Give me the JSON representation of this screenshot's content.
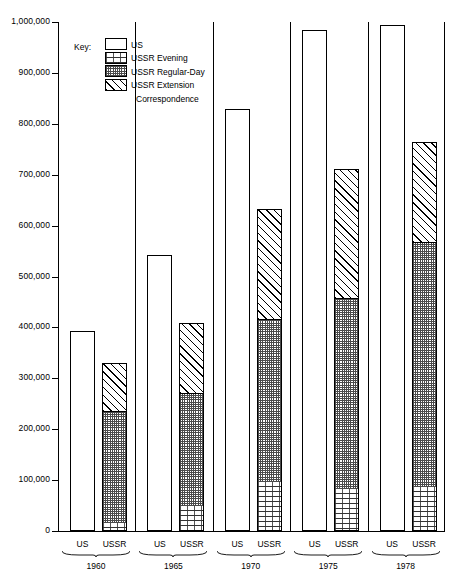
{
  "chart_data": {
    "type": "bar",
    "title": "",
    "subtitle": "",
    "xlabel": "",
    "ylabel": "",
    "ylim": [
      0,
      1000000
    ],
    "grid": false,
    "legend_position": "upper-left-inside",
    "y_ticks": [
      {
        "value": 1000000,
        "label": "1,000,000"
      },
      {
        "value": 900000,
        "label": "900,000"
      },
      {
        "value": 800000,
        "label": "800,000"
      },
      {
        "value": 700000,
        "label": "700,000"
      },
      {
        "value": 600000,
        "label": "600,000"
      },
      {
        "value": 500000,
        "label": "500,000"
      },
      {
        "value": 400000,
        "label": "400,000"
      },
      {
        "value": 300000,
        "label": "300,000"
      },
      {
        "value": 200000,
        "label": "200,000"
      },
      {
        "value": 100000,
        "label": "100,000"
      },
      {
        "value": 0,
        "label": "0"
      }
    ],
    "categories": [
      "1960",
      "1965",
      "1970",
      "1975",
      "1978"
    ],
    "sub_categories": [
      "US",
      "USSR"
    ],
    "series": [
      {
        "name": "US",
        "pattern": "blank",
        "values": [
          393000,
          543000,
          830000,
          985000,
          995000
        ]
      },
      {
        "name": "USSR Evening",
        "pattern": "brick",
        "values": [
          14000,
          48000,
          95000,
          80000,
          85000
        ]
      },
      {
        "name": "USSR Regular-Day",
        "pattern": "checker",
        "values": [
          220000,
          222000,
          320000,
          375000,
          480000
        ]
      },
      {
        "name": "USSR Extension Correspondence",
        "pattern": "diagonal",
        "values": [
          96000,
          138000,
          218000,
          257000,
          200000
        ]
      }
    ],
    "ussr_totals": [
      330000,
      408000,
      633000,
      712000,
      765000
    ],
    "annotations": []
  },
  "legend": {
    "title": "Key:",
    "items": [
      {
        "label": "US",
        "pattern": "blank",
        "label2": ""
      },
      {
        "label": "USSR Evening",
        "pattern": "brick",
        "label2": ""
      },
      {
        "label": "USSR Regular-Day",
        "pattern": "checker",
        "label2": ""
      },
      {
        "label": "USSR Extension",
        "pattern": "diagonal",
        "label2": "Correspondence"
      }
    ]
  },
  "axis": {
    "y_labels": [
      "1,000,000",
      "900,000",
      "800,000",
      "700,000",
      "600,000",
      "500,000",
      "400,000",
      "300,000",
      "200,000",
      "100,000",
      "0"
    ],
    "x_groups": [
      {
        "year": "1960",
        "sub": [
          "US",
          "USSR"
        ]
      },
      {
        "year": "1965",
        "sub": [
          "US",
          "USSR"
        ]
      },
      {
        "year": "1970",
        "sub": [
          "US",
          "USSR"
        ]
      },
      {
        "year": "1975",
        "sub": [
          "US",
          "USSR"
        ]
      },
      {
        "year": "1978",
        "sub": [
          "US",
          "USSR"
        ]
      }
    ]
  },
  "colors": {
    "axis": "#000000",
    "bar_outline": "#000000",
    "background": "#ffffff",
    "pattern_ink": "#000000"
  }
}
